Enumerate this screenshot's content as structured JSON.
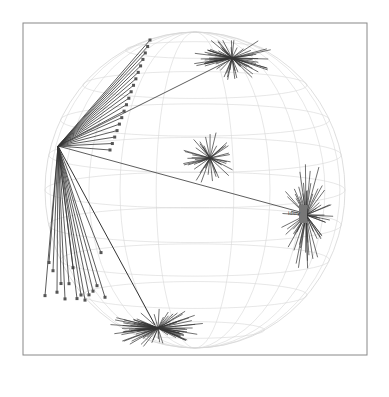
{
  "figure": {
    "hub_label": "Idsry",
    "colors": {
      "frame": "#888888",
      "grid": "#d6d6d6",
      "edge": "#333333",
      "node": "#555555"
    },
    "hubs": [
      {
        "name": "top-right-cluster",
        "cx": 232,
        "cy": 58,
        "spokes": 70,
        "rx": 85,
        "ry": 45
      },
      {
        "name": "center-cluster",
        "cx": 210,
        "cy": 158,
        "spokes": 45,
        "rx": 55,
        "ry": 55
      },
      {
        "name": "bottom-cluster",
        "cx": 158,
        "cy": 328,
        "spokes": 80,
        "rx": 100,
        "ry": 40
      },
      {
        "name": "right-fan",
        "cx": 306,
        "cy": 215,
        "spokes": 60,
        "rx": 55,
        "ry": 110
      },
      {
        "name": "left-hub",
        "cx": 58,
        "cy": 146,
        "spokes": 0,
        "rx": 0,
        "ry": 0
      }
    ]
  }
}
